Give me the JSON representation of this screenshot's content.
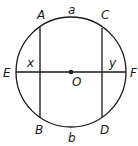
{
  "diagram": {
    "type": "circle-geometry",
    "center_label": "O",
    "points": {
      "A": "A",
      "B": "B",
      "C": "C",
      "D": "D",
      "E": "E",
      "F": "F"
    },
    "arcs": {
      "top": "a",
      "bottom": "b"
    },
    "angles": {
      "left": "x",
      "right": "y"
    },
    "colors": {
      "stroke": "#1a1a1a",
      "background": "#ffffff"
    }
  }
}
